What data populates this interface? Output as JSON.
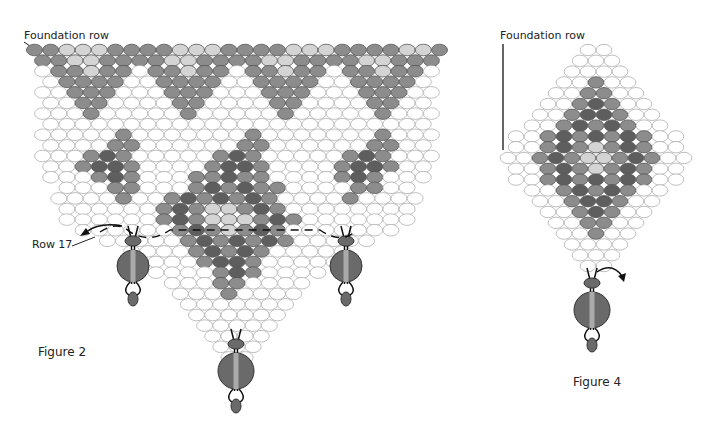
{
  "labels": {
    "fig2_foundation": "Foundation row",
    "fig2_row17": "Row 17",
    "fig2_caption": "Figure 2",
    "fig4_foundation": "Foundation row",
    "fig4_caption": "Figure 4"
  },
  "colors": {
    "white": "#ffffff",
    "light": "#d4d4d4",
    "mid": "#8c8c8c",
    "dark": "#5e5e5e",
    "outline": "#b0b0b0"
  },
  "figure2": {
    "legend": "Pattern rows: W=white, L=light gray, M=medium gray, D=dark gray",
    "rows": [
      "MMLLLMMMMLLLMMMMLLLMMMMLLM",
      "MMLLMMMMLLMMMMLLMMMMLLMMM",
      "WMMLMMWMMLMMWMMLMMWMMLMMW",
      "WMMMMWWMMMMWWMMMMWWMMMMW",
      "WWMMMWWWMMMWWWMMMWWWMMMWW",
      "WWMMWWWWMMWWWWMMWWWWMMWW",
      "WWWMWWWWWMWWWWWMWWWWWMWWW",
      "WWWWWWWWWWWWWWWWWWWWWWWW",
      "WWWWWMWWWWWWWMWWWWWWWMWWW",
      "WWWWMMWWWWWWMMWWWWWWMMWW",
      "WWWMDMWWWWWMDMWWWWWMDMWWW",
      "WWMDDMWWWWMDDMWWWWMDDMWW",
      "WWWMDMWWWMMDMMWWWWMDMWWW",
      "WWWMMWWWMDMDMMWWWWMMWW",
      "WWWWMWWMDMDMDMWWWWMWWWW",
      "WWWWWWMDMLLMDMWWWWWWWW",
      "WWWWWWMDMLLLMDMWWWWWWW",
      "WWWWWWMDMLMDMWWWWWWW",
      "WWWWWMDMDMDMWWWWW",
      "WWWWMDMDMWWWWW",
      "WWWWMDDMWWWWW",
      "WWWWMDMWWWW",
      "WWWMMWWWW",
      "WWWMWWWW",
      "WWWWWWW",
      "WWWWWW",
      "WWWWW",
      "WWWW",
      "WWW",
      "WW"
    ]
  },
  "figure4": {
    "rows": [
      "WW",
      "WWW",
      "WWWW",
      "WWMWW",
      "WWMMWW",
      "WWMDMWW",
      "WWMDDMWW",
      "WWMDMDMWW",
      "WWMDMDMDMWW",
      "WWMDMLMDMWW",
      "WWMDMLLMDMWW",
      "WWMDMLMDMWW",
      "WWMDMDMDMWW",
      "WWMDMDMWW",
      "WWMDDMWW",
      "WWMDMWW",
      "WWMMWW",
      "WWMWW",
      "WWWW",
      "WWW",
      "WW"
    ]
  }
}
